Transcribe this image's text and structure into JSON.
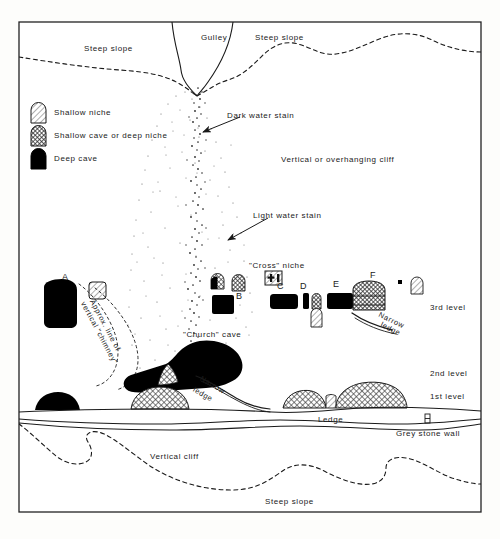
{
  "diagram": {
    "legend": {
      "items": [
        {
          "key": "shallow-niche",
          "label": "Shallow niche",
          "fill": "hatch-light"
        },
        {
          "key": "shallow-cave-or-deep-niche",
          "label": "Shallow cave or deep niche",
          "fill": "hatch-dark"
        },
        {
          "key": "deep-cave",
          "label": "Deep cave",
          "fill": "solid-black"
        }
      ]
    },
    "terrain_labels": {
      "gulley": "Gulley",
      "steep_slope_top_left": "Steep slope",
      "steep_slope_top_right": "Steep slope",
      "steep_slope_bottom": "Steep slope",
      "vertical_cliff_bottom": "Vertical cliff",
      "vertical_or_overhanging_cliff": "Vertical or overhanging cliff",
      "grey_stone_wall": "Grey stone wall",
      "ledge": "Ledge"
    },
    "annotations": {
      "dark_water_stain": "Dark water stain",
      "light_water_stain": "Light water stain",
      "cross_niche": "\"Cross\" niche",
      "church_cave": "\"Church\" cave",
      "chimney_line_1": "Approx.  line  of",
      "chimney_line_2": "vertical \"chimney\"",
      "narrow_ledge_upper_1": "Narrow",
      "narrow_ledge_upper_2": "ledge",
      "narrow_ledge_lower_1": "Narrow",
      "narrow_ledge_lower_2": "ledge"
    },
    "levels": {
      "third": "3rd level",
      "second": "2nd level",
      "first": "1st level"
    },
    "feature_labels": {
      "a": "A",
      "b": "B",
      "c": "C",
      "d": "D",
      "e": "E",
      "f": "F"
    },
    "colors": {
      "ink": "#1a1a1a",
      "solid_fill": "#000000",
      "hatch_dark": "#5a5a5a",
      "hatch_light": "#b8b8b8",
      "paper": "#fdfdfb",
      "border": "#222222"
    }
  }
}
